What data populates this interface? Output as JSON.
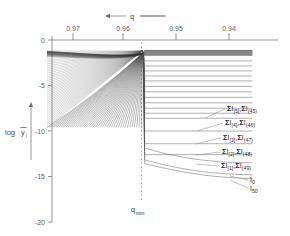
{
  "chart_data": {
    "type": "line",
    "title": "",
    "xlabel": "q",
    "ylabel": "log ȳᵢ",
    "xlim": [
      0.975,
      0.9355
    ],
    "ylim": [
      -20,
      0
    ],
    "x_ticks": [
      "0.97",
      "0.96",
      "0.95",
      "0.94"
    ],
    "x_tick_values": [
      0.97,
      0.96,
      0.95,
      0.94
    ],
    "y_ticks": [
      "0",
      "-5",
      "-10",
      "-15",
      "-20"
    ],
    "y_tick_values": [
      0,
      -5,
      -10,
      -15,
      -20
    ],
    "x_axis_direction": "decreasing",
    "grid": false,
    "legend_position": "right-inline-labels",
    "qmin_label": "q",
    "qmin_sub": "min",
    "qmin_value": 0.9565,
    "axis_arrow_label": "q",
    "series": [
      {
        "name": "ΣI[5],ΣI(45)",
        "plateau": -8.6,
        "label_y": -8.6
      },
      {
        "name": "ΣI[4],ΣI(46)",
        "plateau": -10.0,
        "label_y": -10.0
      },
      {
        "name": "ΣI[3],ΣI(47)",
        "plateau": -11.4,
        "label_y": -11.4
      },
      {
        "name": "ΣI[2],ΣI(48)",
        "plateau": -12.6,
        "label_y": -12.6
      },
      {
        "name": "ΣI[1],ΣI(49)",
        "plateau": -13.5,
        "label_y": -13.5
      },
      {
        "name": "I0",
        "plateau": -14.8,
        "label_y": -14.6
      },
      {
        "name": "I50",
        "plateau": -15.2,
        "label_y": -15.3
      }
    ],
    "plateau_levels": [
      -1.15,
      -1.7,
      -2.3,
      -2.85,
      -3.4,
      -3.95,
      -4.5,
      -5.1,
      -5.7,
      -6.3,
      -6.9,
      -7.5,
      -8.05,
      -8.6,
      -10.0,
      -11.4,
      -12.6,
      -13.5,
      -14.8,
      -15.2
    ],
    "fan_count": 42
  },
  "annotations": {
    "labels": [
      {
        "id": "lbl-5",
        "sym": "Σ",
        "main": "I",
        "sub1": "[5]",
        "sep": ",",
        "sym2": "Σ",
        "main2": "I",
        "sub2": "(45)"
      },
      {
        "id": "lbl-4",
        "sym": "Σ",
        "main": "I",
        "sub1": "[4]",
        "sep": ",",
        "sym2": "Σ",
        "main2": "I",
        "sub2": "(46)"
      },
      {
        "id": "lbl-3",
        "sym": "Σ",
        "main": "I",
        "sub1": "[3]",
        "sep": ",",
        "sym2": "Σ",
        "main2": "I",
        "sub2": "(47)"
      },
      {
        "id": "lbl-2",
        "sym": "Σ",
        "main": "I",
        "sub1": "[2]",
        "sep": ",",
        "sym2": "Σ",
        "main2": "I",
        "sub2": "(48)"
      },
      {
        "id": "lbl-1",
        "sym": "Σ",
        "main": "I",
        "sub1": "[1]",
        "sep": ",",
        "sym2": "Σ",
        "main2": "I",
        "sub2": "(49)"
      }
    ],
    "i_zero": {
      "main": "I",
      "sub": "0"
    },
    "i_fifty": {
      "main": "I",
      "sub": "50"
    }
  },
  "axes": {
    "y_label_log": "log",
    "y_label_var": "y",
    "y_label_sub": "i",
    "x_tick_0": "0.97",
    "x_tick_1": "0.96",
    "x_tick_2": "0.95",
    "x_tick_3": "0.94",
    "y_tick_0": "0",
    "y_tick_1": "-5",
    "y_tick_2": "-10",
    "y_tick_3": "-15",
    "y_tick_4": "-20",
    "top_arrow_label": "q",
    "qmin_main": "q",
    "qmin_sub": "min"
  },
  "colors": {
    "background": "#ffffff",
    "axis": "#7a7a7a",
    "curve": "#4d4d4d",
    "text": "#2b2b2b",
    "dash": "#9a9a9a"
  }
}
